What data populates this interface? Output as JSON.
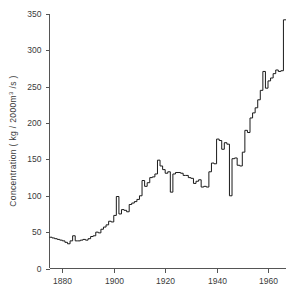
{
  "chart_data": {
    "type": "line",
    "step": "post",
    "title": "",
    "subtitle": "",
    "xlabel": "",
    "ylabel": "Concentration ( kg / 2000m³ /s )",
    "ylabel_parts": {
      "prefix": "Concentration ( kg / 2000m",
      "superscript": "3",
      "suffix": " /s )"
    },
    "xlim": [
      1875,
      1967
    ],
    "ylim": [
      0,
      350
    ],
    "xticks": [
      1880,
      1900,
      1920,
      1940,
      1960
    ],
    "xtick_labels": [
      "1880",
      "1900",
      "1920",
      "1940",
      "1960"
    ],
    "yticks": [
      0,
      50,
      100,
      150,
      200,
      250,
      300,
      350
    ],
    "ytick_labels": [
      "0",
      "50",
      "100",
      "150",
      "200",
      "250",
      "300",
      "350"
    ],
    "grid": false,
    "legend": null,
    "line_color": "#1a1a1a",
    "axis_color": "#555555",
    "text_color": "#3a3a3a",
    "background_color": "#ffffff",
    "series": [
      {
        "name": "Concentration",
        "x": [
          1875,
          1876,
          1877,
          1878,
          1879,
          1880,
          1881,
          1882,
          1883,
          1884,
          1885,
          1886,
          1887,
          1888,
          1889,
          1890,
          1891,
          1892,
          1893,
          1894,
          1895,
          1896,
          1897,
          1898,
          1899,
          1900,
          1901,
          1902,
          1903,
          1904,
          1905,
          1906,
          1907,
          1908,
          1909,
          1910,
          1911,
          1912,
          1913,
          1914,
          1915,
          1916,
          1917,
          1918,
          1919,
          1920,
          1921,
          1922,
          1923,
          1924,
          1925,
          1926,
          1927,
          1928,
          1929,
          1930,
          1931,
          1932,
          1933,
          1934,
          1935,
          1936,
          1937,
          1938,
          1939,
          1940,
          1941,
          1942,
          1943,
          1944,
          1945,
          1946,
          1947,
          1948,
          1949,
          1950,
          1951,
          1952,
          1953,
          1954,
          1955,
          1956,
          1957,
          1958,
          1959,
          1960,
          1961,
          1962,
          1963,
          1964,
          1965,
          1966
        ],
        "values": [
          43,
          42,
          41,
          40,
          39,
          38,
          36,
          34,
          38,
          45,
          38,
          38,
          39,
          40,
          39,
          41,
          44,
          45,
          50,
          49,
          54,
          57,
          60,
          65,
          64,
          73,
          99,
          75,
          81,
          80,
          78,
          88,
          90,
          92,
          95,
          100,
          121,
          113,
          118,
          125,
          126,
          130,
          149,
          141,
          136,
          131,
          133,
          105,
          130,
          132,
          132,
          131,
          128,
          128,
          125,
          124,
          117,
          120,
          122,
          112,
          113,
          112,
          133,
          145,
          144,
          178,
          176,
          164,
          173,
          171,
          100,
          151,
          152,
          142,
          141,
          160,
          190,
          187,
          207,
          214,
          221,
          232,
          245,
          271,
          248,
          258,
          262,
          268,
          273,
          271,
          272,
          342
        ]
      }
    ]
  }
}
